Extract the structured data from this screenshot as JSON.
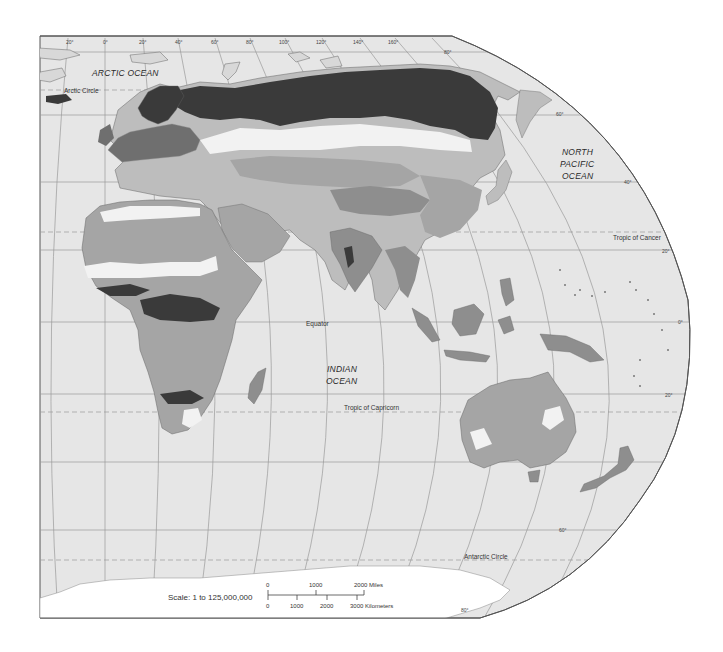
{
  "map": {
    "type": "grayscale vegetation/biome map, Eastern Hemisphere",
    "colors": {
      "background": "#ffffff",
      "ocean": "#e6e6e6",
      "land_light": "#f2f2f2",
      "land_mid_light": "#bdbdbd",
      "land_mid": "#8e8e8e",
      "land_mid_dark": "#6f6f6f",
      "land_dark": "#3a3a3a",
      "graticule": "#9a9a9a",
      "border": "#555555"
    },
    "ocean_labels": {
      "arctic": "ARCTIC  OCEAN",
      "north_pacific_1": "NORTH",
      "north_pacific_2": "PACIFIC",
      "north_pacific_3": "OCEAN",
      "indian_1": "INDIAN",
      "indian_2": "OCEAN"
    },
    "line_labels": {
      "arctic_circle": "Arctic Circle",
      "tropic_cancer": "Tropic of Cancer",
      "equator": "Equator",
      "tropic_capricorn": "Tropic of Capricorn",
      "antarctic_circle": "Antarctic Circle"
    },
    "longitude_labels": [
      "20°",
      "0°",
      "20°",
      "40°",
      "60°",
      "80°",
      "100°",
      "120°",
      "140°",
      "160°"
    ],
    "latitude_labels": {
      "lat80n": "80°",
      "lat60n": "60°",
      "lat40n": "40°",
      "lat20n": "20°",
      "lat0": "0°",
      "lat20s": "20°",
      "lat60s": "60°",
      "lat80s": "80°"
    },
    "scale": {
      "ratio_label": "Scale:  1 to 125,000,000",
      "miles": {
        "t0": "0",
        "t1": "1000",
        "t2": "2000 Miles"
      },
      "km": {
        "t0": "0",
        "t1": "1000",
        "t2": "2000",
        "t3": "3000 Kilometers"
      }
    }
  }
}
